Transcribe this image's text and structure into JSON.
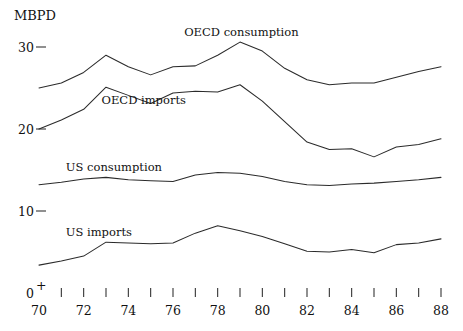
{
  "chart_data": {
    "type": "line",
    "title": "",
    "subtitle": "",
    "unit_label": "MBPD",
    "xlabel": "",
    "ylabel": "MBPD",
    "grid": false,
    "legend_position": "inline-labels",
    "x": [
      70,
      71,
      72,
      73,
      74,
      75,
      76,
      77,
      78,
      79,
      80,
      81,
      82,
      83,
      84,
      85,
      86,
      87,
      88
    ],
    "x_tick_labels": [
      "70",
      "",
      "72",
      "",
      "74",
      "",
      "76",
      "",
      "78",
      "",
      "80",
      "",
      "82",
      "",
      "84",
      "",
      "86",
      "",
      "88"
    ],
    "x_axis_origin_marker": "0+",
    "xlim": [
      70,
      88
    ],
    "ylim": [
      0,
      32
    ],
    "y_ticks": [
      0,
      10,
      20,
      30
    ],
    "y_tick_labels": [
      "0",
      "10",
      "20",
      "30"
    ],
    "series": [
      {
        "name": "OECD consumption",
        "label": "OECD consumption",
        "label_x": 76.5,
        "label_y": 31.4,
        "values": [
          25.0,
          25.6,
          26.9,
          29.0,
          27.6,
          26.6,
          27.6,
          27.7,
          29.0,
          30.6,
          29.5,
          27.4,
          26.0,
          25.4,
          25.6,
          25.6,
          26.3,
          27.0,
          27.6
        ]
      },
      {
        "name": "OECD imports",
        "label": "OECD imports",
        "label_x": 72.8,
        "label_y": 23.0,
        "values": [
          20.0,
          21.1,
          22.4,
          25.1,
          24.1,
          23.1,
          24.4,
          24.6,
          24.5,
          25.4,
          23.4,
          20.9,
          18.4,
          17.5,
          17.6,
          16.6,
          17.8,
          18.1,
          18.8
        ]
      },
      {
        "name": "US consumption",
        "label": "US consumption",
        "label_x": 71.2,
        "label_y": 14.9,
        "values": [
          13.2,
          13.5,
          13.9,
          14.1,
          13.8,
          13.7,
          13.6,
          14.4,
          14.7,
          14.6,
          14.2,
          13.6,
          13.2,
          13.1,
          13.3,
          13.4,
          13.6,
          13.8,
          14.1
        ]
      },
      {
        "name": "US imports",
        "label": "US imports",
        "label_x": 71.2,
        "label_y": 7.0,
        "values": [
          3.4,
          3.9,
          4.5,
          6.2,
          6.1,
          6.0,
          6.1,
          7.3,
          8.2,
          7.6,
          6.9,
          6.0,
          5.1,
          5.0,
          5.3,
          4.9,
          5.9,
          6.1,
          6.6
        ]
      }
    ]
  },
  "annotations": {
    "unit_caption": "MBPD"
  }
}
